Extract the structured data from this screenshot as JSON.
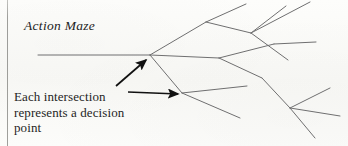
{
  "page": {
    "width": 348,
    "height": 146,
    "background_color": "#fbfbf9",
    "border_color": "#8f8f8b"
  },
  "figure": {
    "title": "Action Maze",
    "caption_lines": [
      "Each intersection",
      "represents a decision",
      "point"
    ],
    "line_color": "#6f6f70",
    "arrow_color": "#111111"
  },
  "diagram": {
    "type": "branching-tree",
    "trunk": {
      "x1": 38,
      "y1": 55,
      "x2": 150,
      "y2": 55
    },
    "nodes": [
      {
        "name": "root-node",
        "x": 150,
        "y": 55
      },
      {
        "name": "upper-node",
        "x": 206,
        "y": 22
      },
      {
        "name": "upper-right-node",
        "x": 251,
        "y": 33
      },
      {
        "name": "middle-node",
        "x": 219,
        "y": 58
      },
      {
        "name": "lower-node",
        "x": 182,
        "y": 93
      },
      {
        "name": "lower-right-node",
        "x": 290,
        "y": 108
      }
    ],
    "branches": [
      {
        "name": "root-to-upper",
        "x1": 150,
        "y1": 55,
        "x2": 206,
        "y2": 22
      },
      {
        "name": "root-to-middle",
        "x1": 150,
        "y1": 55,
        "x2": 219,
        "y2": 58
      },
      {
        "name": "root-to-lower",
        "x1": 150,
        "y1": 55,
        "x2": 182,
        "y2": 93
      },
      {
        "name": "upper-node-up-branch",
        "x1": 206,
        "y1": 22,
        "x2": 246,
        "y2": 4
      },
      {
        "name": "upper-node-to-upper-right",
        "x1": 206,
        "y1": 22,
        "x2": 251,
        "y2": 33
      },
      {
        "name": "upper-right-up-branch",
        "x1": 251,
        "y1": 33,
        "x2": 286,
        "y2": 6
      },
      {
        "name": "upper-right-far-branch",
        "x1": 251,
        "y1": 33,
        "x2": 310,
        "y2": 2
      },
      {
        "name": "upper-right-down-branch",
        "x1": 251,
        "y1": 33,
        "x2": 288,
        "y2": 60
      },
      {
        "name": "middle-node-up-branch",
        "x1": 219,
        "y1": 58,
        "x2": 274,
        "y2": 44
      },
      {
        "name": "middle-node-down-branch",
        "x1": 219,
        "y1": 58,
        "x2": 262,
        "y2": 78
      },
      {
        "name": "middle-upper-tip-branch",
        "x1": 274,
        "y1": 44,
        "x2": 316,
        "y2": 42
      },
      {
        "name": "lower-node-right-branch",
        "x1": 182,
        "y1": 93,
        "x2": 247,
        "y2": 86
      },
      {
        "name": "lower-node-down-branch",
        "x1": 182,
        "y1": 93,
        "x2": 240,
        "y2": 118
      },
      {
        "name": "lower-right-in-branch",
        "x1": 262,
        "y1": 78,
        "x2": 290,
        "y2": 108
      },
      {
        "name": "lower-right-up-branch",
        "x1": 290,
        "y1": 108,
        "x2": 330,
        "y2": 88
      },
      {
        "name": "lower-right-side-branch",
        "x1": 290,
        "y1": 108,
        "x2": 340,
        "y2": 116
      },
      {
        "name": "lower-right-down-branch",
        "x1": 290,
        "y1": 108,
        "x2": 315,
        "y2": 138
      }
    ],
    "annotation_arrows": [
      {
        "name": "arrow-to-root-node",
        "x1": 116,
        "y1": 86,
        "x2": 146,
        "y2": 60
      },
      {
        "name": "arrow-to-lower-node",
        "x1": 128,
        "y1": 92,
        "x2": 178,
        "y2": 94
      }
    ]
  }
}
